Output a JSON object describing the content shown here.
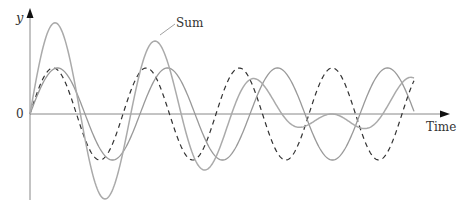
{
  "chart_data": {
    "type": "line",
    "title": "",
    "xlabel": "Time",
    "ylabel": "y",
    "origin_label": "0",
    "annotations": [
      {
        "text": "Sum",
        "points_to": "sum-curve"
      }
    ],
    "series": [
      {
        "name": "Wave 1 (dashed)",
        "style": "dashed",
        "color": "#333333",
        "amplitude": 1.0,
        "period_px": 93
      },
      {
        "name": "Wave 2 (solid)",
        "style": "solid",
        "color": "#999999",
        "amplitude": 1.0,
        "period_px": 110
      },
      {
        "name": "Sum",
        "style": "solid",
        "color": "#aaaaaa",
        "definition": "Wave 1 + Wave 2"
      }
    ],
    "grid": false,
    "legend": "none"
  },
  "labels": {
    "y_axis": "y",
    "x_axis": "Time",
    "origin": "0",
    "sum": "Sum"
  }
}
